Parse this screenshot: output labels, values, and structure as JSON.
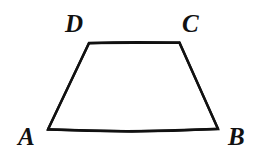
{
  "figure": {
    "kind": "geometry-diagram",
    "shape_name": "trapezoid",
    "background_color": "#ffffff",
    "stroke_color": "#111111",
    "stroke_width": 2.4,
    "canvas": {
      "width": 258,
      "height": 164
    },
    "vertices": [
      {
        "id": "A",
        "label": "A",
        "x": 48,
        "y": 129,
        "label_x": 18,
        "label_y": 124,
        "position": "bottom-left"
      },
      {
        "id": "B",
        "label": "B",
        "x": 218,
        "y": 129,
        "label_x": 228,
        "label_y": 124,
        "position": "bottom-right"
      },
      {
        "id": "C",
        "label": "C",
        "x": 179,
        "y": 43,
        "label_x": 182,
        "label_y": 11,
        "position": "top-right"
      },
      {
        "id": "D",
        "label": "D",
        "x": 89,
        "y": 43,
        "label_x": 65,
        "label_y": 11,
        "position": "top-left"
      }
    ],
    "edges": [
      {
        "id": "AD",
        "from": "A",
        "to": "D"
      },
      {
        "id": "DC",
        "from": "D",
        "to": "C"
      },
      {
        "id": "CB",
        "from": "C",
        "to": "B"
      },
      {
        "id": "BA",
        "from": "B",
        "to": "A"
      }
    ],
    "path_d": "M 48 129.5 L 89 43 L 179.5 42.5 L 218 129 L 132 131.5 Z",
    "outline_points": "48,129.5 89,43 179.5,42.5 218,129"
  }
}
